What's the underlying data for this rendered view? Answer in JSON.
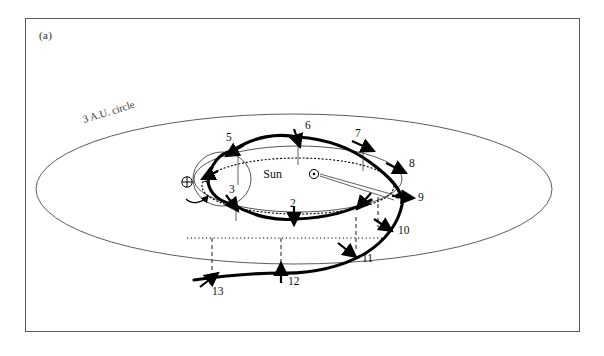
{
  "figure": {
    "panel_label": "(a)",
    "background_color": "#ffffff",
    "frame_color": "#5a5a5a",
    "ink_color": "#000000"
  },
  "annotations": {
    "au_circle_label": "3 A.U. circle",
    "sun_label": "Sun",
    "sun_symbol": "⊙",
    "earth_symbol": "⊕"
  },
  "waypoints": [
    {
      "label": "1",
      "x": 338,
      "y": 196,
      "lx": 334,
      "ly": 186
    },
    {
      "label": "2",
      "x": 268,
      "y": 200,
      "lx": 264,
      "ly": 188
    },
    {
      "label": "3",
      "x": 206,
      "y": 185,
      "lx": 203,
      "ly": 172
    },
    {
      "label": "4",
      "x": 182,
      "y": 163,
      "lx": 180,
      "ly": 162
    },
    {
      "label": "5",
      "x": 206,
      "y": 132,
      "lx": 200,
      "ly": 121
    },
    {
      "label": "6",
      "x": 272,
      "y": 118,
      "lx": 278,
      "ly": 110
    },
    {
      "label": "7",
      "x": 337,
      "y": 127,
      "lx": 331,
      "ly": 117
    },
    {
      "label": "8",
      "x": 370,
      "y": 150,
      "lx": 379,
      "ly": 146
    },
    {
      "label": "9",
      "x": 376,
      "y": 177,
      "lx": 388,
      "ly": 180
    },
    {
      "label": "10",
      "x": 358,
      "y": 206,
      "lx": 371,
      "ly": 213
    },
    {
      "label": "11",
      "x": 320,
      "y": 232,
      "lx": 334,
      "ly": 241
    },
    {
      "label": "12",
      "x": 255,
      "y": 251,
      "lx": 261,
      "ly": 262
    },
    {
      "label": "13",
      "x": 183,
      "y": 258,
      "lx": 185,
      "ly": 272
    }
  ],
  "geometry": {
    "au_ellipse": {
      "cx": 268,
      "cy": 170,
      "rx": 258,
      "ry": 75
    },
    "orbit_ellipse": {
      "cx": 272,
      "cy": 160,
      "rx": 104,
      "ry": 33
    },
    "dotted_ellipse": {
      "cx": 272,
      "cy": 165,
      "rx": 96,
      "ry": 30
    },
    "sun": {
      "cx": 286,
      "cy": 155,
      "r": 4
    },
    "earth": {
      "cx": 161,
      "cy": 163,
      "r": 5
    },
    "dotted_baseline": {
      "x1": 161,
      "x2": 360,
      "y": 219
    }
  }
}
